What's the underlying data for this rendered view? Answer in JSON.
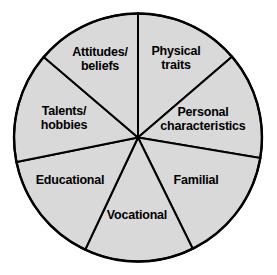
{
  "figure": {
    "type": "pie-diagram",
    "title": "",
    "background_color": "#ffffff",
    "width": 277,
    "height": 275
  },
  "chart_data": {
    "type": "pie",
    "title": "",
    "subtitle": "",
    "xlabel": "",
    "ylabel": "",
    "legend": "none",
    "grid": false,
    "center": {
      "x": 138,
      "y": 137.5
    },
    "radius": 124,
    "fill_color": "#d9d9d9",
    "stroke_color": "#000000",
    "categories": [
      "Physical traits",
      "Personal characteristics",
      "Familial",
      "Vocational",
      "Educational",
      "Talents/ hobbies",
      "Attitudes/ beliefs"
    ],
    "values": [
      50.7,
      50.2,
      54.3,
      51.4,
      53.4,
      51.9,
      48.1
    ],
    "slices": [
      {
        "label": "Physical\ntraits",
        "label_text": "Physical traits",
        "start_angle": -90,
        "end_angle": -40.7,
        "sweep": 49.3,
        "label_x": 176,
        "label_y": 58
      },
      {
        "label": "Personal\ncharacteristics",
        "label_text": "Personal characteristics",
        "start_angle": -40.7,
        "end_angle": 9.5,
        "sweep": 50.2,
        "label_x": 203,
        "label_y": 119
      },
      {
        "label": "Familial",
        "label_text": "Familial",
        "start_angle": 9.5,
        "end_angle": 63.8,
        "sweep": 54.3,
        "label_x": 196,
        "label_y": 181
      },
      {
        "label": "Vocational",
        "label_text": "Vocational",
        "start_angle": 63.8,
        "end_angle": 115.2,
        "sweep": 51.4,
        "label_x": 137,
        "label_y": 216
      },
      {
        "label": "Educational",
        "label_text": "Educational",
        "start_angle": 115.2,
        "end_angle": 168.6,
        "sweep": 53.4,
        "label_x": 70,
        "label_y": 181
      },
      {
        "label": "Talents/\nhobbies",
        "label_text": "Talents/ hobbies",
        "start_angle": 168.6,
        "end_angle": 220.5,
        "sweep": 51.9,
        "label_x": 64,
        "label_y": 118
      },
      {
        "label": "Attitudes/\nbeliefs",
        "label_text": "Attitudes/ beliefs",
        "start_angle": 220.5,
        "end_angle": 270,
        "sweep": 49.5,
        "label_x": 100,
        "label_y": 59
      }
    ]
  }
}
